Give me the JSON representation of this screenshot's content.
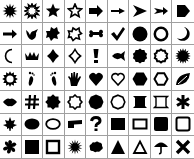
{
  "palette": {
    "title": "Shape gallery",
    "columns": 9,
    "rows": 7,
    "grid_color": "#a0a0a0",
    "shape_color": "#000000",
    "shapes": [
      "explosion-filled",
      "explosion-outline",
      "star-filled",
      "star-outline",
      "arrow-right-block",
      "arrow-right-thin",
      "arrow-right-notched",
      "arrow-right-feather",
      "arrow-pentagon",
      "arrow-right-bold",
      "bird",
      "puzzle-blob-filled",
      "puzzle-blob-outline",
      "bone",
      "checkmark",
      "circle-filled",
      "circle-outline",
      "moon-filled",
      "moon-outline",
      "crown",
      "diamond-filled",
      "diamond-outline",
      "exclamation",
      "fish",
      "seal-filled",
      "seal-outline",
      "sun-burst",
      "sun",
      "footprint-left",
      "footprint-right",
      "hand",
      "heart-filled",
      "heart-outline",
      "hexagon-filled",
      "hexagon-outline",
      "leaf",
      "lips",
      "hash",
      "badge-filled",
      "badge-outline",
      "decagon-filled",
      "decagon-outline",
      "scroll-banner-filled",
      "scroll-banner-outline",
      "asterisk",
      "maple-leaf",
      "ellipse-filled",
      "ellipse-outline",
      "flag",
      "question-mark",
      "rect-filled",
      "rect-outline",
      "rounded-square-filled",
      "rounded-square-outline",
      "flower",
      "square-filled",
      "square-outline",
      "splat",
      "cloud",
      "triangle-filled",
      "triangle-outline",
      "umbrella",
      "x-cross"
    ]
  }
}
